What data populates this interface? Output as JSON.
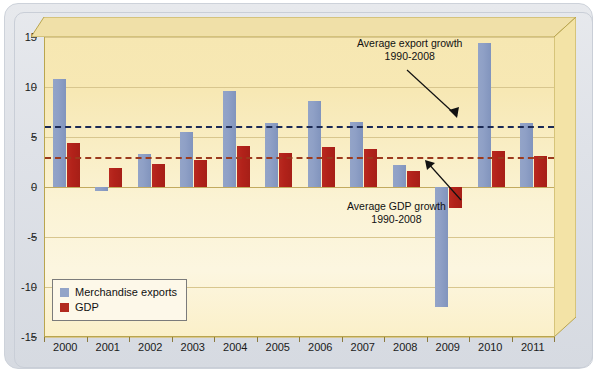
{
  "chart_data": {
    "type": "bar",
    "title": "",
    "xlabel": "",
    "ylabel": "",
    "grid": true,
    "ylim": [
      -15,
      15
    ],
    "yticks": [
      15,
      10,
      5,
      0,
      -5,
      -10,
      -15
    ],
    "ytick_labels": [
      "15",
      "10",
      "5",
      "0",
      "-5",
      "-10",
      "-15"
    ],
    "categories": [
      "2000",
      "2001",
      "2002",
      "2003",
      "2004",
      "2005",
      "2006",
      "2007",
      "2008",
      "2009",
      "2010",
      "2011"
    ],
    "series": [
      {
        "name": "Merchandise exports",
        "color": "#8fa0c6",
        "values": [
          10.8,
          -0.4,
          3.3,
          5.5,
          9.6,
          6.4,
          8.6,
          6.5,
          2.2,
          -12.0,
          14.4,
          6.4
        ]
      },
      {
        "name": "GDP",
        "color": "#b2221a",
        "values": [
          4.4,
          1.9,
          2.3,
          2.7,
          4.1,
          3.4,
          4.0,
          3.8,
          1.6,
          -2.1,
          3.6,
          3.1
        ]
      }
    ],
    "reference_lines": [
      {
        "name": "Average export growth 1990-2008",
        "value": 6.1,
        "color": "#1b2a55",
        "style": "dashed"
      },
      {
        "name": "Average GDP growth 1990-2008",
        "value": 3.0,
        "color": "#9c3a1d",
        "style": "dashed"
      }
    ],
    "annotations": [
      {
        "id": "avg-export-annotation",
        "line1": "Average export growth",
        "line2": "1990-2008"
      },
      {
        "id": "avg-gdp-annotation",
        "line1": "Average GDP growth",
        "line2": "1990-2008"
      }
    ],
    "legend": {
      "position": "lower-left",
      "entries": [
        {
          "label": "Merchandise exports",
          "color": "#93a4c8"
        },
        {
          "label": "GDP",
          "color": "#b22a1e"
        }
      ]
    }
  }
}
